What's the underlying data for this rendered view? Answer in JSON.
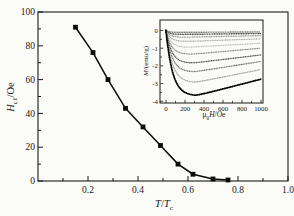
{
  "figure": {
    "background": "#fbfbf8",
    "frame_color": "#1a1a1a",
    "series_color": "#0a0a0a"
  },
  "labels": {
    "main_y": {
      "var": "H",
      "sub": "c1",
      "unit": "/Oe"
    },
    "main_x": {
      "var1": "T",
      "slash": "/",
      "var2": "T",
      "sub": "c"
    },
    "inset_y": {
      "var": "M",
      "unit": "/(emu/g)"
    },
    "inset_x": {
      "mu": "μ",
      "sub": "0",
      "var": "H",
      "unit": "/Oe"
    }
  },
  "chart_data": {
    "main": {
      "type": "line",
      "marker": "square",
      "color": "#0a0a0a",
      "xlabel": "T/Tc",
      "ylabel": "Hc1/Oe",
      "xlim": [
        0,
        1.0
      ],
      "ylim": [
        0,
        100
      ],
      "xticks": [
        0.2,
        0.4,
        0.6,
        0.8,
        1.0
      ],
      "x_minor_step": 0.1,
      "yticks": [
        0,
        20,
        40,
        60,
        80,
        100
      ],
      "y_minor_step": 10,
      "grid": false,
      "points": [
        [
          0.15,
          91
        ],
        [
          0.22,
          76
        ],
        [
          0.28,
          60
        ],
        [
          0.35,
          43
        ],
        [
          0.42,
          32
        ],
        [
          0.49,
          21
        ],
        [
          0.56,
          10
        ],
        [
          0.62,
          4
        ],
        [
          0.7,
          1.2
        ],
        [
          0.76,
          0.6
        ]
      ]
    },
    "inset": {
      "type": "line",
      "xlabel": "μ0H/Oe",
      "ylabel": "M/(emu/g)",
      "xlim": [
        0,
        1000
      ],
      "ylim": [
        -4,
        0.5
      ],
      "xticks": [
        0,
        200,
        400,
        600,
        800,
        1000
      ],
      "x_minor_step": 100,
      "yticks": [
        0,
        -1,
        -2,
        -3,
        -4
      ],
      "y_minor_step": 0.5,
      "grid": false,
      "series_note": "M(H) virgin curves; each starts at M=0, dips to m_min near h_at_min, recovers to m_at_1000",
      "series": [
        {
          "color": "#6e6e6e",
          "m_at_0": 0,
          "m_min": -0.1,
          "h_at_min": 150,
          "m_at_1000": -0.08
        },
        {
          "color": "#3f3f3f",
          "m_at_0": 0,
          "m_min": -0.22,
          "h_at_min": 170,
          "m_at_1000": -0.17
        },
        {
          "color": "#9a9a9a",
          "m_at_0": 0,
          "m_min": -0.38,
          "h_at_min": 190,
          "m_at_1000": -0.29
        },
        {
          "color": "#b3b3b3",
          "m_at_0": 0,
          "m_min": -0.62,
          "h_at_min": 210,
          "m_at_1000": -0.47
        },
        {
          "color": "#c2c2c2",
          "m_at_0": 0,
          "m_min": -0.95,
          "h_at_min": 230,
          "m_at_1000": -0.72
        },
        {
          "color": "#8e8e8e",
          "m_at_0": 0,
          "m_min": -1.35,
          "h_at_min": 250,
          "m_at_1000": -1.0
        },
        {
          "color": "#575757",
          "m_at_0": 0,
          "m_min": -1.85,
          "h_at_min": 270,
          "m_at_1000": -1.38
        },
        {
          "color": "#787878",
          "m_at_0": 0,
          "m_min": -2.35,
          "h_at_min": 285,
          "m_at_1000": -1.75
        },
        {
          "color": "#a3a3a3",
          "m_at_0": 0,
          "m_min": -2.95,
          "h_at_min": 300,
          "m_at_1000": -2.2
        },
        {
          "color": "#000000",
          "m_at_0": 0,
          "m_min": -3.7,
          "h_at_min": 310,
          "m_at_1000": -2.75
        }
      ]
    }
  }
}
